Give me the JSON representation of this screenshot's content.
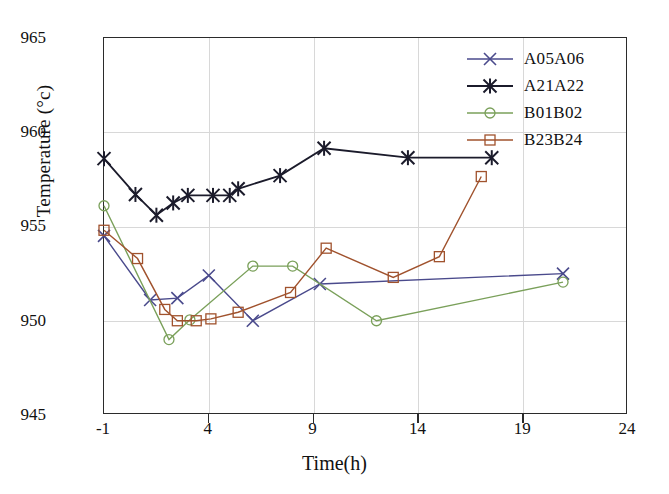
{
  "chart_data": {
    "type": "line",
    "title": "",
    "subtitle": "",
    "xlabel": "Time(h)",
    "ylabel": "Temperature (°c)",
    "xlim": [
      -1,
      24
    ],
    "ylim": [
      945,
      965
    ],
    "xticks": [
      "-1",
      "4",
      "9",
      "14",
      "19",
      "24"
    ],
    "xtick_values": [
      -1,
      4,
      9,
      14,
      19,
      24
    ],
    "yticks": [
      "945",
      "950",
      "955",
      "960",
      "965"
    ],
    "ytick_values": [
      945,
      950,
      955,
      960,
      965
    ],
    "grid": true,
    "legend_position": "top-right",
    "series": [
      {
        "name": "A05A06",
        "color": "#4a4a8c",
        "marker": "x",
        "x": [
          -1.0,
          1.2,
          2.5,
          4.0,
          6.1,
          9.3,
          20.9
        ],
        "y": [
          954.5,
          951.1,
          951.2,
          952.4,
          950.0,
          951.95,
          952.5
        ]
      },
      {
        "name": "A21A22",
        "color": "#1b1b2b",
        "marker": "asterisk",
        "x": [
          -1.0,
          0.5,
          1.5,
          2.3,
          3.0,
          4.2,
          5.0,
          5.4,
          7.4,
          9.5,
          13.5,
          17.5
        ],
        "y": [
          958.6,
          956.7,
          955.6,
          956.25,
          956.65,
          956.65,
          956.65,
          957.0,
          957.7,
          959.15,
          958.65,
          958.65
        ]
      },
      {
        "name": "B01B02",
        "color": "#7aa05a",
        "marker": "circle",
        "x": [
          -1.0,
          2.1,
          3.1,
          6.1,
          8.0,
          12.0,
          20.9
        ],
        "y": [
          956.1,
          949.0,
          950.05,
          952.9,
          952.9,
          950.0,
          952.05
        ]
      },
      {
        "name": "B23B24",
        "color": "#a0522d",
        "marker": "square",
        "x": [
          -1.0,
          0.6,
          1.9,
          2.5,
          3.4,
          4.1,
          5.4,
          7.9,
          9.6,
          12.8,
          15.0,
          17.0
        ],
        "y": [
          954.8,
          953.3,
          950.6,
          950.0,
          950.0,
          950.1,
          950.45,
          951.5,
          953.85,
          952.3,
          953.4,
          957.65
        ],
        "note": "last two points 957.65 at 15.0h and 958.2 at 17.0h"
      }
    ]
  },
  "legend": {
    "items": [
      {
        "label": "A05A06",
        "color": "#4a4a8c",
        "marker": "x"
      },
      {
        "label": "A21A22",
        "color": "#1b1b2b",
        "marker": "asterisk"
      },
      {
        "label": "B01B02",
        "color": "#7aa05a",
        "marker": "circle"
      },
      {
        "label": "B23B24",
        "color": "#a0522d",
        "marker": "square"
      }
    ]
  },
  "axes": {
    "y_label_text": "Temperature (°c)",
    "x_label_text": "Time(h)"
  }
}
